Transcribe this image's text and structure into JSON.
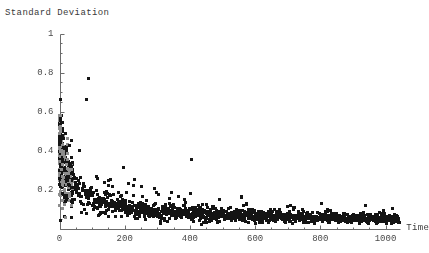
{
  "chart_data": {
    "type": "scatter",
    "title": "",
    "xlabel": "Time",
    "ylabel": "Standard Deviation",
    "xlim": [
      0,
      1050
    ],
    "ylim": [
      0,
      1
    ],
    "grid": false,
    "legend": null,
    "marker": {
      "shape": "square",
      "size_px": 2.6,
      "color": "#141414"
    },
    "xticks": [
      0,
      200,
      400,
      600,
      800,
      1000
    ],
    "xtick_labels": [
      "0",
      "200",
      "400",
      "600",
      "800",
      "1000"
    ],
    "yticks": [
      0,
      0.2,
      0.4,
      0.6,
      0.8,
      1
    ],
    "ytick_labels": [
      "0",
      "0.2",
      "0.4",
      "0.6",
      "0.8",
      "1"
    ],
    "ytick_labels_drawn": [
      "0.2",
      "0.4",
      "0.6",
      "0.8",
      "1"
    ],
    "minor_tick_count_between_major": 3,
    "axis_color": "#6b6b6b",
    "envelope_model": {
      "form": "mean = a / sqrt(t + t0)",
      "a": 1.62,
      "t0": 14,
      "noise_relative_sigma": 0.26
    },
    "n_points": 1000,
    "outliers": [
      {
        "x": 88,
        "y": 0.77
      },
      {
        "x": 82,
        "y": 0.665
      },
      {
        "x": 404,
        "y": 0.357
      },
      {
        "x": 196,
        "y": 0.315
      },
      {
        "x": 36,
        "y": 0.45
      },
      {
        "x": 30,
        "y": 0.425
      },
      {
        "x": 22,
        "y": 0.4
      },
      {
        "x": 60,
        "y": 0.4
      },
      {
        "x": 116,
        "y": 0.255
      },
      {
        "x": 150,
        "y": 0.245
      },
      {
        "x": 290,
        "y": 0.205
      },
      {
        "x": 344,
        "y": 0.185
      },
      {
        "x": 250,
        "y": 0.215
      }
    ]
  },
  "axes": {
    "y_title": "Standard Deviation",
    "x_title": "Time"
  }
}
